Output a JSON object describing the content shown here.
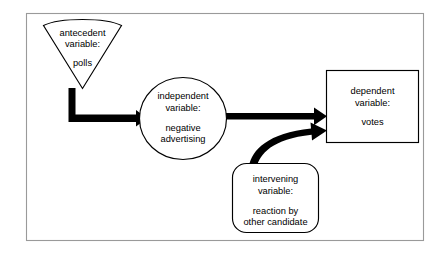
{
  "diagram": {
    "background_color": "#ffffff",
    "frame_color": "#9a9a9a",
    "shape_stroke_color": "#000000",
    "arrow_color": "#000000",
    "nodes": {
      "antecedent": {
        "shape": "triangle-down",
        "line1": "antecedent",
        "line2": "variable:",
        "line3": "polls"
      },
      "independent": {
        "shape": "circle",
        "line1": "independent",
        "line2": "variable:",
        "line3": "negative",
        "line4": "advertising"
      },
      "dependent": {
        "shape": "rectangle",
        "line1": "dependent",
        "line2": "variable:",
        "line3": "votes"
      },
      "intervening": {
        "shape": "rounded-rectangle",
        "line1": "intervening",
        "line2": "variable:",
        "line3": "reaction by",
        "line4": "other candidate"
      }
    },
    "connectors": [
      {
        "name": "antecedent-to-independent",
        "style": "elbow-arrow",
        "from": "antecedent",
        "to": "independent"
      },
      {
        "name": "independent-to-dependent",
        "style": "straight-arrow",
        "from": "independent",
        "to": "dependent"
      },
      {
        "name": "intervening-to-dependent",
        "style": "curved-arrow",
        "from": "intervening",
        "to": "dependent"
      }
    ]
  }
}
